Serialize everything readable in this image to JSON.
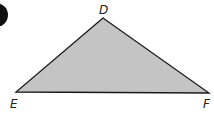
{
  "diagram": {
    "type": "triangle",
    "vertices": [
      {
        "label": "D",
        "x": 103,
        "y": 18
      },
      {
        "label": "E",
        "x": 16,
        "y": 92
      },
      {
        "label": "F",
        "x": 209,
        "y": 93
      }
    ],
    "labels": {
      "D": "D",
      "E": "E",
      "F": "F"
    },
    "fill_color": "#c4c4c4",
    "stroke_color": "#1a1a1a",
    "marker_color": "#111111"
  }
}
